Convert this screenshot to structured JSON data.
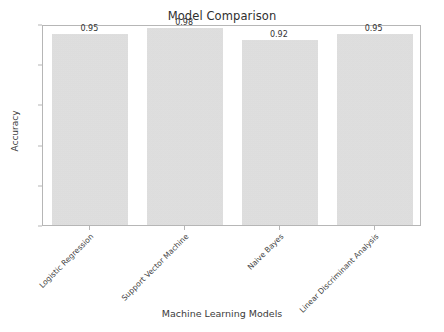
{
  "chart_data": {
    "type": "bar",
    "title": "Model Comparison",
    "xlabel": "Machine Learning Models",
    "ylabel": "Accuracy",
    "categories": [
      "Logistic Regression",
      "Support Vector Machine",
      "Naive Bayes",
      "Linear Discriminant Analysis"
    ],
    "values": [
      0.95,
      0.98,
      0.92,
      0.95
    ],
    "value_labels": [
      "0.95",
      "0.98",
      "0.92",
      "0.95"
    ],
    "ylim": [
      0.0,
      1.0
    ],
    "yticks": [
      "0.0",
      "0.2",
      "0.4",
      "0.6",
      "0.8",
      "1.0"
    ],
    "ytick_values": [
      0.0,
      0.2,
      0.4,
      0.6,
      0.8,
      1.0
    ],
    "grid": false,
    "legend": null,
    "bar_color": "#d6d6d6",
    "text_color": "#3b3b3b",
    "axes_color": "#b6b6b6",
    "background": "#ffffff",
    "xtick_rotation": -45
  }
}
